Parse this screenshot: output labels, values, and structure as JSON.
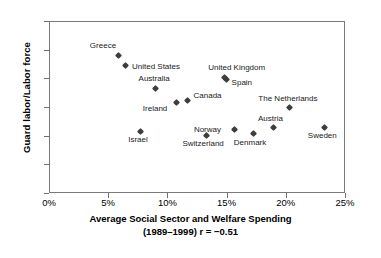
{
  "chart_data": {
    "type": "scatter",
    "title": "",
    "xlabel": "Average Social Sector and Welfare Spending",
    "xlabel_line2": "(1989–1999) r = −0.51",
    "ylabel": "Guard labor/Labor force",
    "xlim": [
      0,
      25
    ],
    "ylim": [
      0,
      30
    ],
    "xticks": [
      "0%",
      "5%",
      "10%",
      "15%",
      "20%",
      "25%"
    ],
    "xtick_values": [
      0,
      5,
      10,
      15,
      20,
      25
    ],
    "yticks": [
      "0%",
      "5%",
      "10%",
      "15%",
      "20%",
      "25%",
      "30%"
    ],
    "ytick_values": [
      0,
      5,
      10,
      15,
      20,
      25,
      30
    ],
    "grid": false,
    "legend": "none",
    "correlation": "r = −0.51",
    "period": "1989–1999",
    "points": [
      {
        "label": "Greece",
        "x": 5.9,
        "y": 24.0,
        "lx": -29,
        "ly": -14
      },
      {
        "label": "United States",
        "x": 6.5,
        "y": 22.2,
        "lx": 6,
        "ly": -4
      },
      {
        "label": "Australia",
        "x": 9.0,
        "y": 18.3,
        "lx": -17,
        "ly": -14
      },
      {
        "label": "Ireland",
        "x": 10.8,
        "y": 15.7,
        "lx": -34,
        "ly": 1
      },
      {
        "label": "Canada",
        "x": 11.7,
        "y": 16.2,
        "lx": 6,
        "ly": -9
      },
      {
        "label": "United Kingdom",
        "x": 14.8,
        "y": 20.1,
        "lx": -16,
        "ly": -15
      },
      {
        "label": "Spain",
        "x": 15.0,
        "y": 19.8,
        "lx": 5,
        "ly": -1
      },
      {
        "label": "The Netherlands",
        "x": 20.3,
        "y": 15.0,
        "lx": -31,
        "ly": -13
      },
      {
        "label": "Austria",
        "x": 19.0,
        "y": 11.5,
        "lx": -16,
        "ly": -13
      },
      {
        "label": "Israel",
        "x": 7.7,
        "y": 10.8,
        "lx": -12,
        "ly": 4
      },
      {
        "label": "Switzerland",
        "x": 13.3,
        "y": 10.1,
        "lx": -24,
        "ly": 4
      },
      {
        "label": "Norway",
        "x": 15.7,
        "y": 11.0,
        "lx": -41,
        "ly": -5
      },
      {
        "label": "Denmark",
        "x": 17.3,
        "y": 10.3,
        "lx": -20,
        "ly": 4
      },
      {
        "label": "Sweden",
        "x": 23.3,
        "y": 11.5,
        "lx": -17,
        "ly": 4
      }
    ]
  },
  "colors": {
    "marker": "#3d3d3d",
    "axis": "#7a7a7a",
    "text": "#000000"
  }
}
